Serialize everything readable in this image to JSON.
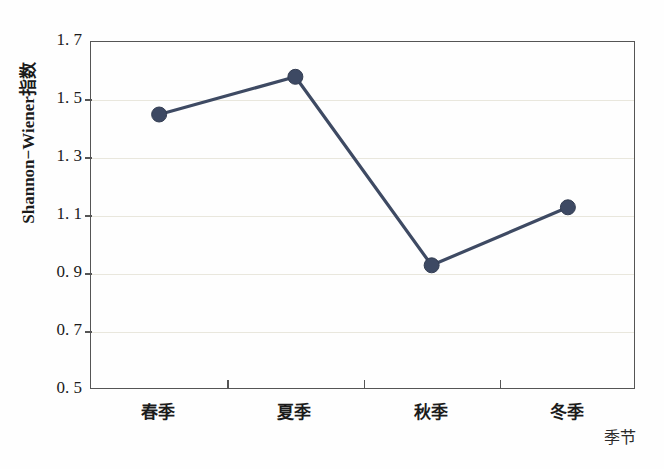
{
  "chart_data": {
    "type": "line",
    "title": "",
    "subtitle": "",
    "xlabel": "季节",
    "ylabel": "Shannon−Wiener指数",
    "categories": [
      "春季",
      "夏季",
      "秋季",
      "冬季"
    ],
    "values": [
      1.45,
      1.58,
      0.93,
      1.13
    ],
    "series": [
      {
        "name": "Shannon−Wiener指数",
        "values": [
          1.45,
          1.58,
          0.93,
          1.13
        ]
      }
    ],
    "ylim": [
      0.5,
      1.7
    ],
    "ytick_labels": [
      "1. 7",
      "1. 5",
      "1. 3",
      "1. 1",
      "0. 9",
      "0. 7",
      "0. 5"
    ],
    "ytick_values": [
      1.7,
      1.5,
      1.3,
      1.1,
      0.9,
      0.7,
      0.5
    ],
    "grid": "horizontal",
    "legend": "none",
    "marker": "filled-circle",
    "colors": {
      "line": "#3e4a63",
      "marker": "#3d4963",
      "grid": "#e9e7dd",
      "frame": "#555555",
      "background": "#fefefe",
      "text": "#1b1b1b"
    }
  }
}
